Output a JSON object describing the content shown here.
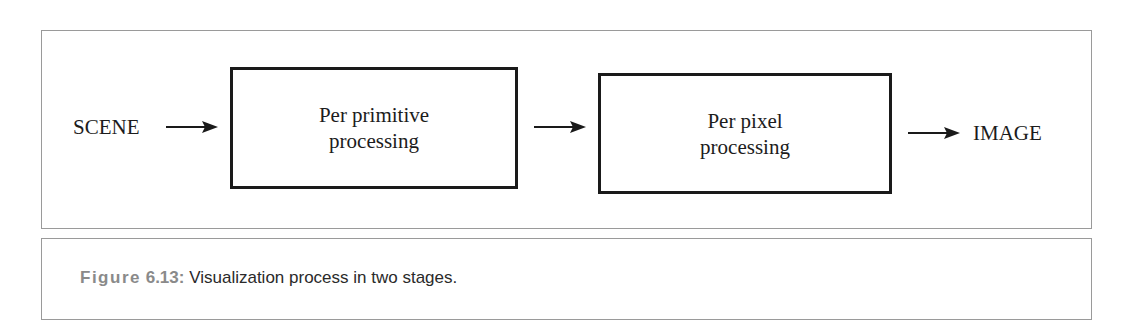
{
  "diagram": {
    "input_label": "SCENE",
    "stages": [
      {
        "line1": "Per primitive",
        "line2": "processing"
      },
      {
        "line1": "Per pixel",
        "line2": "processing"
      }
    ],
    "output_label": "IMAGE",
    "arrows": [
      "scene-to-stage1",
      "stage1-to-stage2",
      "stage2-to-image"
    ]
  },
  "caption": {
    "figure_word": "Figure",
    "figure_number": "6.13:",
    "text": "Visualization process in two stages."
  },
  "colors": {
    "frame_border": "#9a9a9a",
    "box_border": "#1a1a1a",
    "caption_label": "#8a8a8a",
    "text": "#1c1c1c"
  }
}
